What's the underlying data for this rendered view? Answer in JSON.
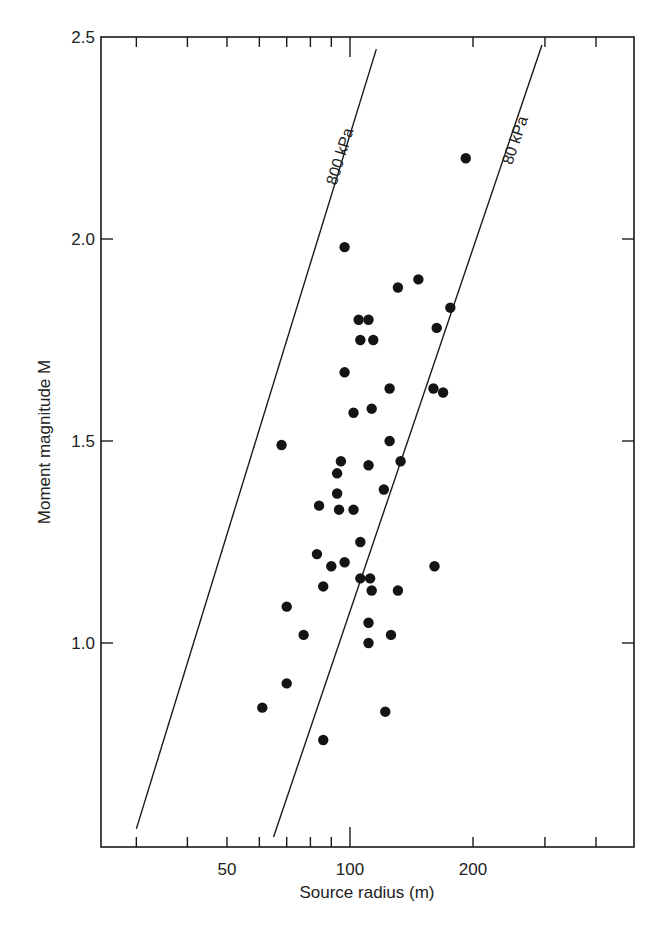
{
  "chart_data": {
    "type": "scatter",
    "title": "",
    "xlabel": "Source radius (m)",
    "ylabel": "Moment magnitude M",
    "xscale": "log",
    "xlim": [
      24.4,
      493
    ],
    "ylim": [
      0.495,
      2.5
    ],
    "grid": false,
    "legend": null,
    "x_tick_labels": [
      {
        "value": 50,
        "label": "50"
      },
      {
        "value": 100,
        "label": "100"
      },
      {
        "value": 200,
        "label": "200"
      }
    ],
    "x_minor_ticks": [
      30,
      40,
      50,
      60,
      70,
      80,
      90,
      200,
      300,
      400
    ],
    "x_major_ticks": [
      100
    ],
    "y_tick_labels": [
      {
        "value": 2.5,
        "label": "2.5"
      },
      {
        "value": 2.0,
        "label": "2.0"
      },
      {
        "value": 1.5,
        "label": "1.5"
      },
      {
        "value": 1.0,
        "label": "1.0"
      }
    ],
    "series": [
      {
        "name": "events",
        "marker": "filled-circle",
        "points": [
          {
            "r": 192,
            "M": 2.2
          },
          {
            "r": 97,
            "M": 1.98
          },
          {
            "r": 147,
            "M": 1.9
          },
          {
            "r": 131,
            "M": 1.88
          },
          {
            "r": 176,
            "M": 1.83
          },
          {
            "r": 105,
            "M": 1.8
          },
          {
            "r": 111,
            "M": 1.8
          },
          {
            "r": 163,
            "M": 1.78
          },
          {
            "r": 106,
            "M": 1.75
          },
          {
            "r": 114,
            "M": 1.75
          },
          {
            "r": 97,
            "M": 1.67
          },
          {
            "r": 125,
            "M": 1.63
          },
          {
            "r": 160,
            "M": 1.63
          },
          {
            "r": 169,
            "M": 1.62
          },
          {
            "r": 102,
            "M": 1.57
          },
          {
            "r": 113,
            "M": 1.58
          },
          {
            "r": 125,
            "M": 1.5
          },
          {
            "r": 68,
            "M": 1.49
          },
          {
            "r": 95,
            "M": 1.45
          },
          {
            "r": 111,
            "M": 1.44
          },
          {
            "r": 133,
            "M": 1.45
          },
          {
            "r": 93,
            "M": 1.42
          },
          {
            "r": 93,
            "M": 1.37
          },
          {
            "r": 121,
            "M": 1.38
          },
          {
            "r": 84,
            "M": 1.34
          },
          {
            "r": 94,
            "M": 1.33
          },
          {
            "r": 102,
            "M": 1.33
          },
          {
            "r": 106,
            "M": 1.25
          },
          {
            "r": 83,
            "M": 1.22
          },
          {
            "r": 90,
            "M": 1.19
          },
          {
            "r": 97,
            "M": 1.2
          },
          {
            "r": 161,
            "M": 1.19
          },
          {
            "r": 86,
            "M": 1.14
          },
          {
            "r": 106,
            "M": 1.16
          },
          {
            "r": 112,
            "M": 1.16
          },
          {
            "r": 113,
            "M": 1.13
          },
          {
            "r": 131,
            "M": 1.13
          },
          {
            "r": 70,
            "M": 1.09
          },
          {
            "r": 77,
            "M": 1.02
          },
          {
            "r": 111,
            "M": 1.05
          },
          {
            "r": 126,
            "M": 1.02
          },
          {
            "r": 111,
            "M": 1.0
          },
          {
            "r": 70,
            "M": 0.9
          },
          {
            "r": 61,
            "M": 0.84
          },
          {
            "r": 122,
            "M": 0.83
          },
          {
            "r": 86,
            "M": 0.76
          }
        ]
      }
    ],
    "reference_lines": [
      {
        "name": "stress-drop-800kpa",
        "label": "800 kPa",
        "from": {
          "r": 30,
          "M": 0.54
        },
        "to": {
          "r": 116,
          "M": 2.47
        }
      },
      {
        "name": "stress-drop-80kpa",
        "label": "80 kPa",
        "from": {
          "r": 65,
          "M": 0.52
        },
        "to": {
          "r": 295,
          "M": 2.48
        }
      }
    ],
    "annotations": [
      "800 kPa",
      "80 kPa"
    ]
  },
  "layout": {
    "plot": {
      "left": 101,
      "right": 634,
      "top": 37,
      "bottom": 847
    },
    "x_px_per_decade": 408.6,
    "x_ref_value": 100,
    "x_ref_px": 350,
    "y_px_per_unit": 404
  }
}
